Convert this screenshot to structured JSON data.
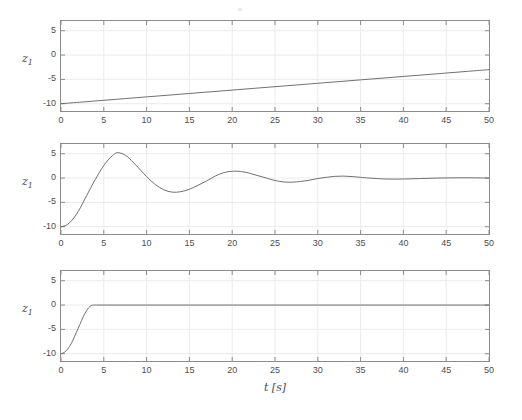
{
  "figure": {
    "background_color": "#ffffff",
    "line_color": "#606060",
    "axis_color": "#8c8c8c",
    "grid_color": "#ebebeb",
    "text_color": "#4d4d4d",
    "xlabel": "t [s]",
    "xlabel_t": "t",
    "xlabel_unit": "[s]",
    "ylabel_base": "z",
    "ylabel_sub": "1",
    "ylabel": "z1"
  },
  "chart_data": [
    {
      "type": "line",
      "title": "",
      "panel_index": 1,
      "xlabel": "",
      "ylabel": "z1",
      "xlim": [
        0,
        50
      ],
      "ylim": [
        -11.5,
        7.0
      ],
      "xticks": [
        0,
        5,
        10,
        15,
        20,
        25,
        30,
        35,
        40,
        45,
        50
      ],
      "xtick_labels": [
        "0",
        "5",
        "10",
        "15",
        "20",
        "25",
        "30",
        "35",
        "40",
        "45",
        "50"
      ],
      "yticks": [
        -10,
        -5,
        0,
        5
      ],
      "ytick_labels": [
        "-10",
        "-5",
        "0",
        "5"
      ],
      "grid": true,
      "legend": null,
      "series": [
        {
          "name": "z1 ramp",
          "x": [
            0,
            2.5,
            5,
            7.5,
            10,
            12.5,
            15,
            17.5,
            20,
            22.5,
            25,
            27.5,
            30,
            32.5,
            35,
            37.5,
            40,
            42.5,
            45,
            47.5,
            50
          ],
          "y": [
            -10.0,
            -9.65,
            -9.3,
            -8.95,
            -8.6,
            -8.25,
            -7.9,
            -7.55,
            -7.2,
            -6.85,
            -6.5,
            -6.15,
            -5.8,
            -5.45,
            -5.1,
            -4.75,
            -4.4,
            -4.05,
            -3.7,
            -3.35,
            -3.0
          ]
        }
      ]
    },
    {
      "type": "line",
      "title": "",
      "panel_index": 2,
      "xlabel": "",
      "ylabel": "z1",
      "xlim": [
        0,
        50
      ],
      "ylim": [
        -11.5,
        7.0
      ],
      "xticks": [
        0,
        5,
        10,
        15,
        20,
        25,
        30,
        35,
        40,
        45,
        50
      ],
      "xtick_labels": [
        "0",
        "5",
        "10",
        "15",
        "20",
        "25",
        "30",
        "35",
        "40",
        "45",
        "50"
      ],
      "yticks": [
        -10,
        -5,
        0,
        5
      ],
      "ytick_labels": [
        "-10",
        "-5",
        "0",
        "5"
      ],
      "grid": true,
      "legend": null,
      "series": [
        {
          "name": "z1 damped oscillation",
          "x": [
            0,
            0.5,
            1,
            1.5,
            2,
            2.5,
            3,
            3.5,
            4,
            4.5,
            5,
            5.5,
            6,
            6.5,
            7,
            7.5,
            8,
            9,
            10,
            11,
            12,
            13,
            14,
            15,
            16,
            17,
            18,
            19,
            20,
            21,
            22,
            23,
            24,
            25,
            26,
            27,
            28,
            29,
            30,
            31,
            32,
            33,
            34,
            35,
            36,
            38,
            40,
            42,
            44,
            46,
            48,
            50
          ],
          "y": [
            -10.0,
            -9.8,
            -9.2,
            -8.2,
            -6.9,
            -5.3,
            -3.6,
            -1.9,
            -0.3,
            1.2,
            2.6,
            3.7,
            4.6,
            5.2,
            5.1,
            4.7,
            4.0,
            2.2,
            0.3,
            -1.3,
            -2.4,
            -2.9,
            -2.8,
            -2.3,
            -1.5,
            -0.6,
            0.4,
            1.1,
            1.4,
            1.35,
            1.0,
            0.5,
            0.0,
            -0.5,
            -0.8,
            -0.85,
            -0.7,
            -0.45,
            -0.1,
            0.15,
            0.35,
            0.4,
            0.3,
            0.15,
            0.0,
            -0.2,
            -0.2,
            -0.1,
            0.0,
            0.05,
            0.05,
            0.0
          ]
        }
      ]
    },
    {
      "type": "line",
      "title": "",
      "panel_index": 3,
      "xlabel": "t [s]",
      "ylabel": "z1",
      "xlim": [
        0,
        50
      ],
      "ylim": [
        -11.5,
        7.0
      ],
      "xticks": [
        0,
        5,
        10,
        15,
        20,
        25,
        30,
        35,
        40,
        45,
        50
      ],
      "xtick_labels": [
        "0",
        "5",
        "10",
        "15",
        "20",
        "25",
        "30",
        "35",
        "40",
        "45",
        "50"
      ],
      "yticks": [
        -10,
        -5,
        0,
        5
      ],
      "ytick_labels": [
        "-10",
        "-5",
        "0",
        "5"
      ],
      "grid": true,
      "legend": null,
      "series": [
        {
          "name": "z1 saturating rise",
          "x": [
            0,
            0.2,
            0.4,
            0.6,
            0.8,
            1.0,
            1.2,
            1.4,
            1.6,
            1.8,
            2.0,
            2.2,
            2.4,
            2.6,
            2.8,
            3.0,
            3.2,
            3.4,
            3.6,
            3.8,
            4.0,
            5,
            10,
            15,
            20,
            25,
            30,
            35,
            40,
            45,
            50
          ],
          "y": [
            -10.0,
            -9.9,
            -9.7,
            -9.4,
            -9.0,
            -8.5,
            -7.9,
            -7.2,
            -6.4,
            -5.6,
            -4.8,
            -4.0,
            -3.2,
            -2.4,
            -1.7,
            -1.1,
            -0.6,
            -0.25,
            -0.05,
            0.0,
            0.0,
            0.0,
            0.0,
            0.0,
            0.0,
            0.0,
            0.0,
            0.0,
            0.0,
            0.0,
            0.0
          ]
        }
      ]
    }
  ],
  "panels": [
    {
      "name": "panel-1",
      "box": {
        "left": 60,
        "top": 20,
        "width": 430,
        "height": 92
      },
      "ylabel_pos": {
        "left": 22,
        "top": 60
      },
      "show_xtick_labels": true,
      "show_xlabel": false
    },
    {
      "name": "panel-2",
      "box": {
        "left": 60,
        "top": 143,
        "width": 430,
        "height": 92
      },
      "ylabel_pos": {
        "left": 22,
        "top": 183
      },
      "show_xtick_labels": true,
      "show_xlabel": false
    },
    {
      "name": "panel-3",
      "box": {
        "left": 60,
        "top": 270,
        "width": 430,
        "height": 92
      },
      "ylabel_pos": {
        "left": 22,
        "top": 310
      },
      "show_xtick_labels": true,
      "show_xlabel": true
    }
  ]
}
